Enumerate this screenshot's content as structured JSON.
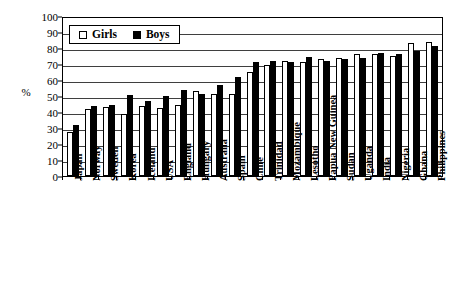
{
  "chart_data": {
    "type": "bar",
    "title": "",
    "subtitle": "",
    "xlabel": "",
    "ylabel": "%",
    "ylim": [
      0,
      100
    ],
    "ytick_step": 10,
    "yticks": [
      100,
      90,
      80,
      70,
      60,
      50,
      40,
      30,
      20,
      10,
      0
    ],
    "grid": true,
    "legend_position": "top-left",
    "legend": [
      "Girls",
      "Boys"
    ],
    "colors": {
      "girls": "#ffffff",
      "boys": "#000000",
      "outline": "#000000",
      "grid": "#3f3f3f"
    },
    "categories": [
      "Japan",
      "Norway",
      "Sweden",
      "Korea",
      "Iceland",
      "USA",
      "England",
      "Hungary",
      "Australia",
      "Spain",
      "Chile",
      "Trinidad",
      "Mozambique",
      "Lesotho",
      "Papua New Guinea",
      "Sudan",
      "Uganda",
      "India",
      "Nigeria",
      "Ghana",
      "Philippines"
    ],
    "series": [
      {
        "name": "Girls",
        "values": [
          27.5,
          42,
          43,
          39,
          43.5,
          42.5,
          44.5,
          53,
          51.5,
          51.5,
          65,
          69.5,
          72,
          71.5,
          73,
          74,
          76,
          76,
          75,
          83,
          83.5
        ]
      },
      {
        "name": "Boys",
        "values": [
          32,
          44,
          44.5,
          50.5,
          47,
          50,
          53.5,
          51.5,
          57,
          62,
          71.5,
          72,
          71.5,
          74.5,
          72,
          73,
          73.5,
          77,
          76.5,
          78,
          81.5
        ]
      }
    ]
  },
  "axis": {
    "y_title": "%",
    "tick_labels": [
      "100",
      "90",
      "80",
      "70",
      "60",
      "50",
      "40",
      "30",
      "20",
      "10",
      "0"
    ]
  },
  "legend": {
    "girls_label": "Girls",
    "boys_label": "Boys"
  }
}
